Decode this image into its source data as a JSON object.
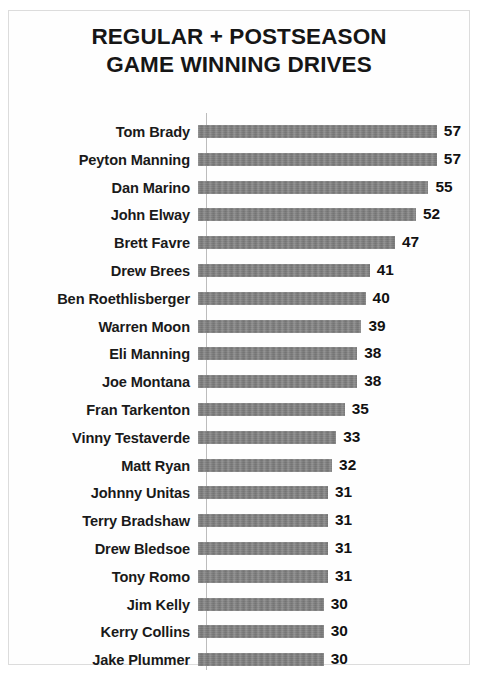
{
  "chart_data": {
    "type": "bar",
    "orientation": "horizontal",
    "title": "REGULAR + POSTSEASON\nGAME WINNING DRIVES",
    "title_line1": "REGULAR + POSTSEASON",
    "title_line2": "GAME WINNING DRIVES",
    "xlabel": "",
    "ylabel": "",
    "xlim": [
      0,
      57
    ],
    "grid": false,
    "legend": false,
    "bar_color": "#7d7d7d",
    "text_color": "#1a1a1a",
    "axis_color": "#bcbcbc",
    "categories": [
      "Tom Brady",
      "Peyton Manning",
      "Dan Marino",
      "John Elway",
      "Brett Favre",
      "Drew Brees",
      "Ben Roethlisberger",
      "Warren Moon",
      "Eli Manning",
      "Joe Montana",
      "Fran Tarkenton",
      "Vinny Testaverde",
      "Matt Ryan",
      "Johnny Unitas",
      "Terry Bradshaw",
      "Drew Bledsoe",
      "Tony Romo",
      "Jim Kelly",
      "Kerry Collins",
      "Jake Plummer"
    ],
    "values": [
      57,
      57,
      55,
      52,
      47,
      41,
      40,
      39,
      38,
      38,
      35,
      33,
      32,
      31,
      31,
      31,
      31,
      30,
      30,
      30
    ],
    "value_labels": [
      "57",
      "57",
      "55",
      "52",
      "47",
      "41",
      "40",
      "39",
      "38",
      "38",
      "35",
      "33",
      "32",
      "31",
      "31",
      "31",
      "31",
      "30",
      "30",
      "30"
    ]
  }
}
